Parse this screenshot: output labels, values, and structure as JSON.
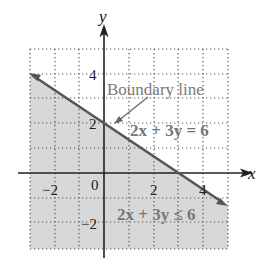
{
  "figure": {
    "axes": {
      "x_label": "x",
      "y_label": "y",
      "x_ticks": [
        {
          "value": -2,
          "label": "−2"
        },
        {
          "value": 0,
          "label": "0"
        },
        {
          "value": 2,
          "label": "2"
        },
        {
          "value": 4,
          "label": "4"
        }
      ],
      "y_ticks": [
        {
          "value": 4,
          "label": "4"
        },
        {
          "value": 2,
          "label": "2"
        },
        {
          "value": -2,
          "label": "−2"
        }
      ],
      "x_range": [
        -3,
        5
      ],
      "y_range": [
        -3,
        5
      ],
      "grid": "dotted, 1 unit spacing"
    },
    "annotations": {
      "boundary_label": "Boundary line",
      "equation": "2x + 3y = 6",
      "inequality": "2x + 3y ≤ 6"
    },
    "boundary_line": {
      "from": [
        -3,
        4
      ],
      "to": [
        4.5,
        -1
      ]
    },
    "shaded_region": "below boundary line",
    "colors": {
      "shade": "#d9d9d9",
      "line": "#555555",
      "text_gray": "#777777",
      "axis": "#222222"
    }
  }
}
